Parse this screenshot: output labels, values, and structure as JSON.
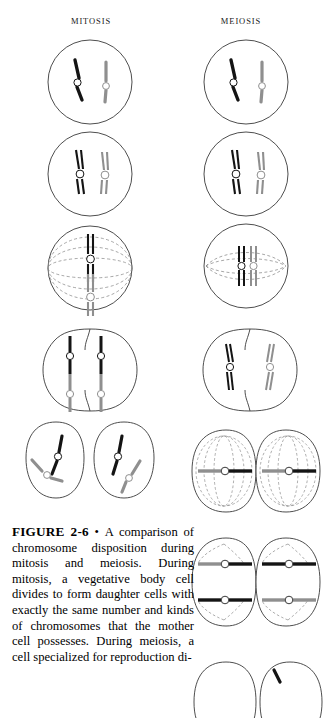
{
  "figure": {
    "columns": [
      {
        "id": "mitosis",
        "heading": "MITOSIS"
      },
      {
        "id": "meiosis",
        "heading": "MEIOSIS"
      }
    ],
    "caption": {
      "figure_number": "FIGURE 2-6",
      "separator": "•",
      "text": "A comparison of chromosome disposition during mitosis and meiosis. During mitosis, a vegetative body cell divides to form daughter cells with exactly the same number and kinds of chromosomes that the mother cell possesses. During meiosis, a cell specialized for reproduction di-"
    },
    "legend": {
      "dark_chromosome_color": "#141414",
      "light_chromosome_color": "#8f8f8f",
      "cell_outline_color": "#3a3a3a",
      "spindle_fiber_color": "#8a8a8a",
      "centromere_fill": "#ffffff"
    },
    "mitosis_stages": [
      {
        "index": 1,
        "label": "interphase-single-chromosomes",
        "description": "Round cell containing one dark and one light unduplicated chromosome, each with an open centromere."
      },
      {
        "index": 2,
        "label": "prophase-duplicated-chromosomes",
        "description": "Round cell with each chromosome duplicated into two sister chromatids joined at the centromere."
      },
      {
        "index": 3,
        "label": "metaphase",
        "description": "Cell with dashed spindle fibers; both duplicated chromosomes aligned vertically on the metaphase plate."
      },
      {
        "index": 4,
        "label": "anaphase-telophase",
        "description": "Constricting cell splitting into two, each half receiving one dark and one light chromatid."
      },
      {
        "index": 5,
        "label": "two-daughter-cells",
        "description": "Two separate daughter cells, each containing one dark and one light chromosome identical to the mother cell."
      }
    ],
    "meiosis_stages": [
      {
        "index": 1,
        "label": "interphase-single-chromosomes",
        "description": "Round cell containing one dark and one light unduplicated chromosome, each with an open centromere."
      },
      {
        "index": 2,
        "label": "prophase-i-duplicated-chromosomes",
        "description": "Round cell with each chromosome duplicated into two sister chromatids joined at the centromere."
      },
      {
        "index": 3,
        "label": "metaphase-i-synapsis",
        "description": "Cell with spindle; homologous dark and light chromosomes paired side by side at the equator."
      },
      {
        "index": 4,
        "label": "anaphase-i",
        "description": "Cell constricting in two; whole duplicated chromosomes move to opposite poles, one dark and one light."
      },
      {
        "index": 5,
        "label": "metaphase-ii",
        "description": "Two cells each with a spindle and one duplicated chromosome aligned horizontally at its equator."
      },
      {
        "index": 6,
        "label": "anaphase-ii",
        "description": "Two dividing cells, each separating its chromatids so four haploid products will form."
      },
      {
        "index": 7,
        "label": "four-haploid-cells",
        "description": "Bottom row of resulting cells, cropped by the page edge."
      }
    ]
  }
}
